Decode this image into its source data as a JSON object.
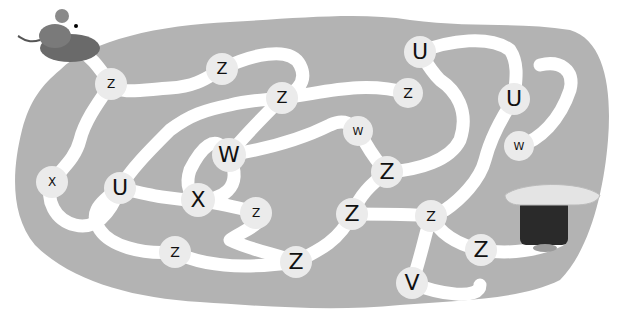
{
  "colors": {
    "background": "#ffffff",
    "blob": "#b3b3b3",
    "path": "#ffffff",
    "node": "#ebebeb",
    "letter": "#111111"
  },
  "maze": {
    "start": "mouse-in-slipper",
    "goal": "tree-stump-house",
    "nodes": [
      {
        "letter": "Z",
        "x": 111,
        "y": 84,
        "d": 32,
        "fs": 12
      },
      {
        "letter": "Z",
        "x": 222,
        "y": 69,
        "d": 32,
        "fs": 16
      },
      {
        "letter": "Z",
        "x": 282,
        "y": 98,
        "d": 32,
        "fs": 16
      },
      {
        "letter": "U",
        "x": 420,
        "y": 52,
        "d": 32,
        "fs": 22
      },
      {
        "letter": "Z",
        "x": 408,
        "y": 93,
        "d": 30,
        "fs": 14
      },
      {
        "letter": "U",
        "x": 514,
        "y": 99,
        "d": 32,
        "fs": 22
      },
      {
        "letter": "W",
        "x": 358,
        "y": 131,
        "d": 30,
        "fs": 11
      },
      {
        "letter": "W",
        "x": 229,
        "y": 155,
        "d": 34,
        "fs": 22
      },
      {
        "letter": "W",
        "x": 519,
        "y": 146,
        "d": 30,
        "fs": 11
      },
      {
        "letter": "Z",
        "x": 387,
        "y": 172,
        "d": 32,
        "fs": 22
      },
      {
        "letter": "X",
        "x": 52,
        "y": 182,
        "d": 32,
        "fs": 12
      },
      {
        "letter": "U",
        "x": 120,
        "y": 188,
        "d": 32,
        "fs": 22
      },
      {
        "letter": "X",
        "x": 198,
        "y": 200,
        "d": 34,
        "fs": 22
      },
      {
        "letter": "Z",
        "x": 256,
        "y": 213,
        "d": 32,
        "fs": 12
      },
      {
        "letter": "Z",
        "x": 352,
        "y": 214,
        "d": 32,
        "fs": 22
      },
      {
        "letter": "Z",
        "x": 431,
        "y": 216,
        "d": 32,
        "fs": 14
      },
      {
        "letter": "Z",
        "x": 175,
        "y": 252,
        "d": 32,
        "fs": 14
      },
      {
        "letter": "Z",
        "x": 296,
        "y": 262,
        "d": 32,
        "fs": 22
      },
      {
        "letter": "Z",
        "x": 481,
        "y": 250,
        "d": 32,
        "fs": 22
      },
      {
        "letter": "V",
        "x": 412,
        "y": 283,
        "d": 32,
        "fs": 22
      }
    ]
  }
}
